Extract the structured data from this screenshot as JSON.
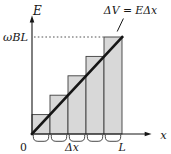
{
  "figure": {
    "labels": {
      "y_axis": "E",
      "x_axis": "x",
      "y_tick": "ωBL",
      "origin": "0",
      "interval_width": "Δx",
      "x_end": "L",
      "annotation": "ΔV = EΔx"
    },
    "colors": {
      "background": "#ffffff",
      "bar_fill": "#d8d8d8",
      "bar_stroke": "#3f3f3f",
      "ink": "#161616",
      "dash": "#3f3f3f"
    }
  },
  "chart_data": {
    "type": "line",
    "title": "",
    "xlabel": "x",
    "ylabel": "E",
    "x_tick_labels": [
      "0",
      "Δx",
      "L"
    ],
    "y_tick_labels": [
      "ωBL"
    ],
    "series": [
      {
        "name": "E versus x, straight line through origin",
        "x": [
          "0",
          "L"
        ],
        "y": [
          "0",
          "ωBL"
        ]
      }
    ],
    "bars": {
      "count": 5,
      "relative_heights": [
        1,
        2,
        3,
        4,
        5
      ],
      "width_label": "Δx",
      "annotation": "ΔV = EΔx",
      "description": "Right-endpoint rectangles; top-right corner of each bar lies on the line"
    },
    "guides": [
      {
        "type": "dashed-horizontal",
        "y": "ωBL",
        "spans": "from E axis to last bar"
      }
    ],
    "grid": false,
    "legend": false
  }
}
